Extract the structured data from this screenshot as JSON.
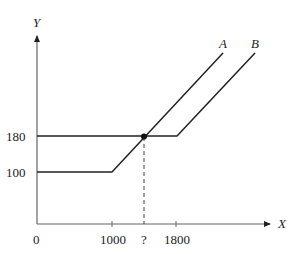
{
  "diagram": {
    "axes": {
      "x_label": "X",
      "y_label": "Y",
      "origin_label": "0"
    },
    "x_ticks": [
      {
        "label": "1000",
        "value": 1000
      },
      {
        "label": "?",
        "value": null
      },
      {
        "label": "1800",
        "value": 1800
      }
    ],
    "y_ticks": [
      {
        "label": "180",
        "value": 180
      },
      {
        "label": "100",
        "value": 100
      }
    ],
    "lines": [
      {
        "name": "A",
        "label": "A",
        "description": "flat at 100 until X=1000, then rises linearly"
      },
      {
        "name": "B",
        "label": "B",
        "description": "flat at 180 until X=1800, then rises linearly"
      }
    ],
    "intersection": {
      "label": "?",
      "y_value": 180,
      "description": "Line A crosses line B's flat segment at Y=180"
    },
    "colors": {
      "line": "#222222",
      "axis": "#555555"
    }
  }
}
